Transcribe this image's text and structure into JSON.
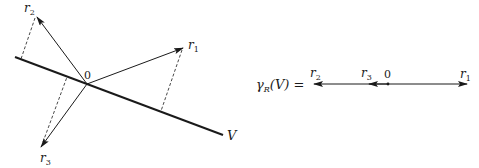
{
  "left_diagram": {
    "origin_label": "0",
    "line_label": "V",
    "vectors": [
      {
        "name": "r",
        "sub": "1"
      },
      {
        "name": "r",
        "sub": "2"
      },
      {
        "name": "r",
        "sub": "3"
      }
    ]
  },
  "right_diagram": {
    "equation": {
      "gamma": "γ",
      "gamma_sub": "R",
      "arg": "(V) ="
    },
    "origin_label": "0",
    "vectors": [
      {
        "name": "r",
        "sub": "2"
      },
      {
        "name": "r",
        "sub": "3"
      },
      {
        "name": "r",
        "sub": "1"
      }
    ]
  },
  "colors": {
    "ink": "#1a1a1a",
    "background": "#ffffff"
  }
}
